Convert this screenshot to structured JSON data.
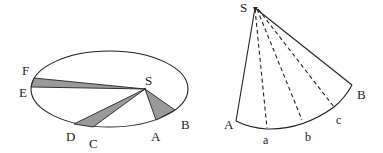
{
  "figure_left": {
    "description": "Elliptical orbit with focus S and three shaded equal-area sectors",
    "focus_label": "S",
    "sectors": [
      {
        "start": "E",
        "end": "F"
      },
      {
        "start": "C",
        "end": "D"
      },
      {
        "start": "A",
        "end": "B"
      }
    ],
    "point_labels": {
      "F": "F",
      "E": "E",
      "D": "D",
      "C": "C",
      "A": "A",
      "B": "B",
      "S": "S"
    }
  },
  "figure_right": {
    "description": "Sector SAB divided by dashed lines from S to points a, b, c on arc AB",
    "point_labels": {
      "S": "S",
      "A": "A",
      "B": "B",
      "a": "a",
      "b": "b",
      "c": "c"
    }
  },
  "colors": {
    "line": "#222222",
    "shade": "#9a9a9a",
    "background": "#ffffff"
  }
}
